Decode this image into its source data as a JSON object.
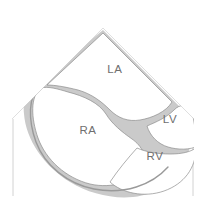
{
  "figure": {
    "kind": "echocardiogram-four-chamber-schematic",
    "modality_view": "apical four chamber sector scan"
  },
  "colors": {
    "background": "#ffffff",
    "chamber_fill": "#ffffff",
    "myocardium_gray": "#c9c9c9",
    "myocardium_gray_light": "#d8d8d8",
    "endocardium_outline": "#808080",
    "sector_edge": "#b4b4b4",
    "depth_marker": "#cfcfcf",
    "label_text": "#6f6f6f"
  },
  "sector": {
    "apex_x": 103,
    "apex_y": 28,
    "left_edge_x": 13,
    "right_edge_x": 193,
    "left_marker_label": "",
    "right_marker_label": ""
  },
  "chambers": [
    {
      "id": "la",
      "label": "LA",
      "name": "left-atrium",
      "x": 115,
      "y": 70
    },
    {
      "id": "ra",
      "label": "RA",
      "name": "right-atrium",
      "x": 88,
      "y": 131
    },
    {
      "id": "lv",
      "label": "LV",
      "name": "left-ventricle",
      "x": 170,
      "y": 120
    },
    {
      "id": "rv",
      "label": "RV",
      "name": "right-ventricle",
      "x": 155,
      "y": 157
    }
  ]
}
